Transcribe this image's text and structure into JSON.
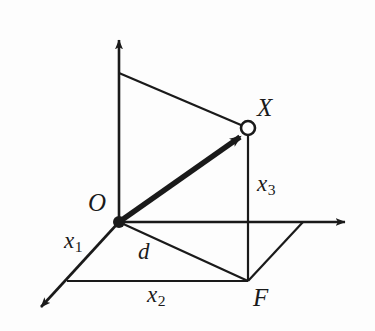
{
  "figure": {
    "background_color": "#fdfdfd",
    "ink_color": "#1a1a1a",
    "width": 375,
    "height": 331
  },
  "labels": {
    "origin": "O",
    "point_x": "X",
    "foot_f": "F",
    "axis_x1_base": "x",
    "axis_x1_sub": "1",
    "axis_x2_base": "x",
    "axis_x2_sub": "2",
    "axis_x3_base": "x",
    "axis_x3_sub": "3",
    "distance_d": "d"
  },
  "geometry": {
    "origin": {
      "x": 119,
      "y": 222
    },
    "point_x": {
      "x": 248,
      "y": 128
    },
    "foot_f": {
      "x": 248,
      "y": 281
    },
    "vertical_axis_tip": {
      "x": 119,
      "y": 33
    },
    "horizontal_axis_tip": {
      "x": 352,
      "y": 222
    },
    "diagonal_axis_tip": {
      "x": 35,
      "y": 313
    },
    "vertical_top_branch": {
      "x": 119,
      "y": 73
    },
    "base_left_corner": {
      "x": 67,
      "y": 281
    },
    "base_right_corner": {
      "x": 303,
      "y": 222
    },
    "vector_head": {
      "x": 248,
      "y": 131
    },
    "point_x_radius": 7,
    "origin_dot_radius": 6
  },
  "label_positions": {
    "origin": {
      "x": 88,
      "y": 190
    },
    "point_x": {
      "x": 257,
      "y": 95
    },
    "foot_f": {
      "x": 253,
      "y": 285
    },
    "axis_x1": {
      "x": 64,
      "y": 229
    },
    "axis_x2": {
      "x": 147,
      "y": 283
    },
    "axis_x3": {
      "x": 257,
      "y": 172
    },
    "distance_d": {
      "x": 138,
      "y": 240
    }
  }
}
